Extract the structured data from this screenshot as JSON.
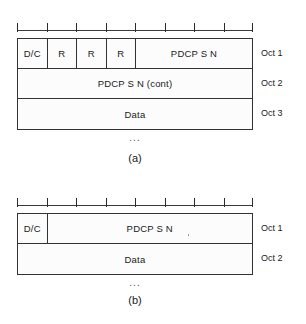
{
  "figures": [
    {
      "id": "a",
      "caption": "(a)",
      "continuation": "...",
      "bit_ruler": {
        "bits": 8,
        "tick_count": 9
      },
      "octet_labels": [
        "Oct 1",
        "Oct 2",
        "Oct 3"
      ],
      "rows": [
        {
          "octet": "Oct 1",
          "cells": [
            {
              "label": "D/C",
              "bits": 1
            },
            {
              "label": "R",
              "bits": 1
            },
            {
              "label": "R",
              "bits": 1
            },
            {
              "label": "R",
              "bits": 1
            },
            {
              "label": "PDCP S N",
              "bits": 4
            }
          ]
        },
        {
          "octet": "Oct 2",
          "cells": [
            {
              "label": "PDCP S N (cont)",
              "bits": 8
            }
          ]
        },
        {
          "octet": "Oct 3",
          "cells": [
            {
              "label": "Data",
              "bits": 8
            }
          ]
        }
      ]
    },
    {
      "id": "b",
      "caption": "(b)",
      "continuation": "...",
      "bit_ruler": {
        "bits": 8,
        "tick_count": 9
      },
      "octet_labels": [
        "Oct 1",
        "Oct 2"
      ],
      "rows": [
        {
          "octet": "Oct 1",
          "cells": [
            {
              "label": "D/C",
              "bits": 1
            },
            {
              "label": "PDCP S N",
              "bits": 7
            }
          ]
        },
        {
          "octet": "Oct 2",
          "cells": [
            {
              "label": "Data",
              "bits": 8
            }
          ]
        }
      ]
    }
  ],
  "colors": {
    "stroke": "#333333",
    "text": "#1a1a1a",
    "background": "#ffffff"
  }
}
